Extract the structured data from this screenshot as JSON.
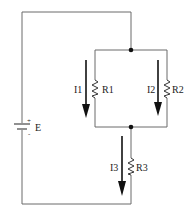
{
  "diagram": {
    "type": "series-parallel circuit",
    "source": {
      "label": "E",
      "plus": "+",
      "minus": "-"
    },
    "resistors": [
      {
        "id": "R1",
        "label": "R1",
        "branch": "parallel-left"
      },
      {
        "id": "R2",
        "label": "R2",
        "branch": "parallel-right"
      },
      {
        "id": "R3",
        "label": "R3",
        "branch": "series"
      }
    ],
    "currents": [
      {
        "id": "I1",
        "label": "I1",
        "direction": "down"
      },
      {
        "id": "I2",
        "label": "I2",
        "direction": "down"
      },
      {
        "id": "I3",
        "label": "I3",
        "direction": "down"
      }
    ],
    "colors": {
      "wire": "#6b6b6b",
      "arrow": "#111111",
      "node": "#111111",
      "background": "#ffffff"
    }
  }
}
